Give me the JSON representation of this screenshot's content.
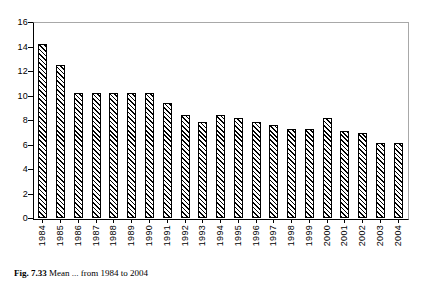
{
  "chart_data": {
    "type": "bar",
    "title": "",
    "xlabel": "",
    "ylabel": "",
    "ylim": [
      0,
      16
    ],
    "yticks": [
      0,
      2,
      4,
      6,
      8,
      10,
      12,
      14,
      16
    ],
    "grid": false,
    "legend": null,
    "categories": [
      "1984",
      "1985",
      "1986",
      "1987",
      "1988",
      "1989",
      "1990",
      "1991",
      "1992",
      "1993",
      "1994",
      "1995",
      "1996",
      "1997",
      "1998",
      "1999",
      "2000",
      "2001",
      "2002",
      "2003",
      "2004"
    ],
    "values": [
      14.2,
      12.5,
      10.2,
      10.2,
      10.2,
      10.2,
      10.2,
      9.4,
      8.4,
      7.8,
      8.4,
      8.2,
      7.8,
      7.6,
      7.3,
      7.3,
      8.2,
      7.1,
      6.9,
      6.1,
      6.1
    ],
    "bar_fill": "diagonal-hatch",
    "bar_color": "#000000",
    "axis_color": "#000000",
    "frame_color": "#a8a8a8"
  },
  "caption": {
    "label": "Fig. 7.33",
    "text": "Mean ... from 1984 to 2004"
  }
}
